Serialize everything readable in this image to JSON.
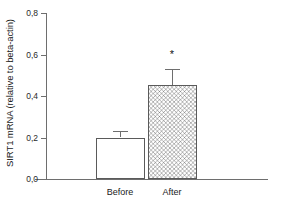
{
  "chart_data": {
    "type": "bar",
    "title": "",
    "subtitle": "",
    "xlabel": "",
    "ylabel": "SIRT1 mRNA (relative to beta-actin)",
    "categories": [
      "Before",
      "After"
    ],
    "values": [
      0.2,
      0.455
    ],
    "errors": [
      0.03,
      0.075
    ],
    "ylim": [
      0.0,
      0.8
    ],
    "ytick_labels": [
      "0,0",
      "0,2",
      "0,4",
      "0,6",
      "0,8"
    ],
    "ytick_values": [
      0.0,
      0.2,
      0.4,
      0.6,
      0.8
    ],
    "grid": false,
    "legend": null,
    "decimal_separator": ",",
    "annotations": [
      {
        "text": "*",
        "category": "After",
        "y": 0.62,
        "meaning": "significant-difference-marker"
      }
    ],
    "bar_styles": [
      {
        "category": "Before",
        "fill": "white",
        "edge_color": "#5a5a5a"
      },
      {
        "category": "After",
        "fill": "crosshatch",
        "edge_color": "#5a5a5a"
      }
    ],
    "colors": {
      "axis": "#6e6e6e",
      "text": "#1a1a1a",
      "bar_edge": "#5a5a5a",
      "hatch": "#5a5a5a",
      "background": "#ffffff"
    }
  }
}
